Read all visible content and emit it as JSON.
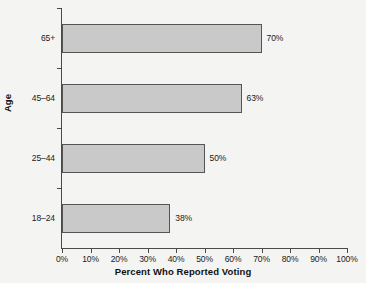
{
  "chart_data": {
    "type": "bar",
    "orientation": "horizontal",
    "title": "",
    "xlabel": "Percent Who Reported Voting",
    "ylabel": "Age",
    "categories": [
      "65+",
      "45–64",
      "25–44",
      "18–24"
    ],
    "values": [
      70,
      63,
      50,
      38
    ],
    "value_labels": [
      "70%",
      "63%",
      "50%",
      "38%"
    ],
    "xlim": [
      0,
      100
    ],
    "xticks": [
      0,
      10,
      20,
      30,
      40,
      50,
      60,
      70,
      80,
      90,
      100
    ],
    "xtick_labels": [
      "0%",
      "10%",
      "20%",
      "30%",
      "40%",
      "50%",
      "60%",
      "70%",
      "80%",
      "90%",
      "100%"
    ],
    "grid": false,
    "legend": false,
    "colors": {
      "bar_fill": "#c9c9c9",
      "bar_border": "#555555",
      "axis": "#4a4a4a",
      "text": "#1a1a1a",
      "background": "#f4f4f2"
    }
  }
}
